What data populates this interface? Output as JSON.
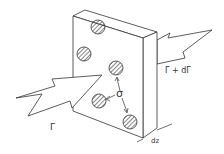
{
  "diagram": {
    "labels": {
      "incoming_flux": "Γ",
      "outgoing_flux": "Γ + dΓ",
      "spacing": "σ",
      "thickness": "dz"
    },
    "colors": {
      "stroke": "#333333",
      "background": "#ffffff"
    }
  }
}
